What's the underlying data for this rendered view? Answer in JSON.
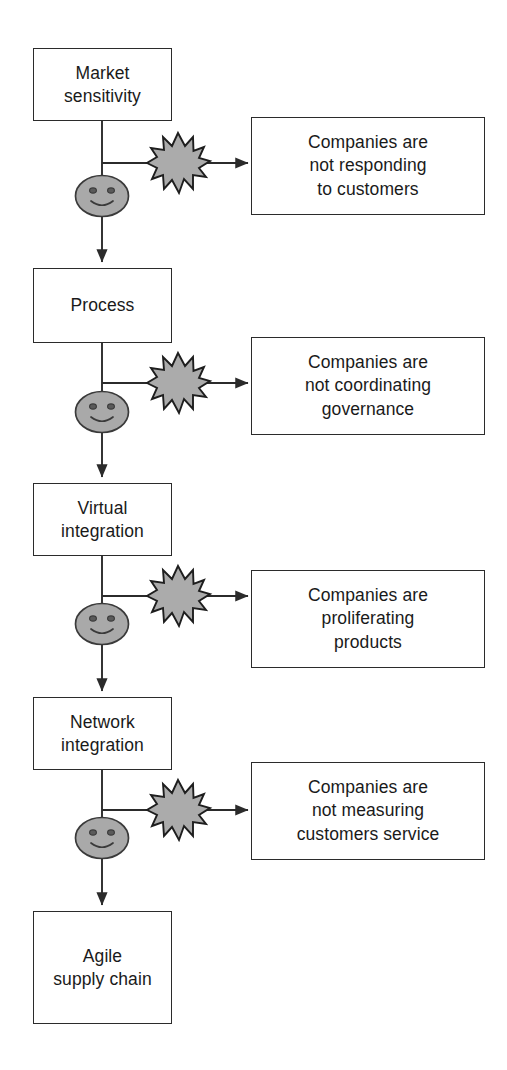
{
  "diagram": {
    "type": "flowchart",
    "orientation": "vertical",
    "colors": {
      "stroke": "#2b2b2b",
      "box_fill": "#ffffff",
      "burst_fill": "#aaaaaa",
      "smiley_fill": "#a8a8a8",
      "text": "#1a1a1a"
    },
    "flow_nodes": [
      {
        "id": "market-sensitivity",
        "label": "Market\nsensitivity",
        "line1": "Market",
        "line2": "sensitivity"
      },
      {
        "id": "process",
        "label": "Process",
        "line1": "Process",
        "line2": ""
      },
      {
        "id": "virtual-integration",
        "label": "Virtual\nintegration",
        "line1": "Virtual",
        "line2": "integration"
      },
      {
        "id": "network-integration",
        "label": "Network\nintegration",
        "line1": "Network",
        "line2": "integration"
      },
      {
        "id": "agile-supply-chain",
        "label": "Agile\nsupply chain",
        "line1": "Agile",
        "line2": "supply chain"
      }
    ],
    "issue_boxes": [
      {
        "id": "issue-responding",
        "lines": [
          "Companies are",
          "not responding",
          "to customers"
        ]
      },
      {
        "id": "issue-coordinating",
        "lines": [
          "Companies are",
          "not coordinating",
          "governance"
        ]
      },
      {
        "id": "issue-proliferating",
        "lines": [
          "Companies are",
          "proliferating",
          "products"
        ]
      },
      {
        "id": "issue-measuring",
        "lines": [
          "Companies are",
          "not measuring",
          "customers service"
        ]
      }
    ],
    "connectors": {
      "burst_icon_name": "starburst-icon",
      "smiley_icon_name": "smiley-face-icon",
      "arrow_icon_name": "arrow-right-icon",
      "down_arrow_icon_name": "arrow-down-icon",
      "burst_count": 4,
      "smiley_count": 4
    }
  }
}
